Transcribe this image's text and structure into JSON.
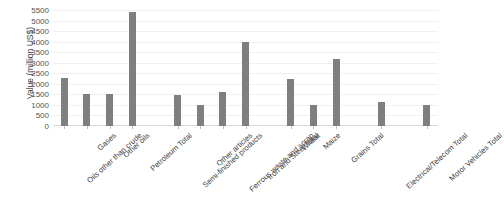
{
  "chart_data": {
    "type": "bar",
    "title": "",
    "xlabel": "",
    "ylabel": "Value (million US$)",
    "ylim": [
      0,
      5500
    ],
    "yticks": [
      0,
      500,
      1000,
      1500,
      2000,
      2500,
      3000,
      3500,
      4000,
      4500,
      5000,
      5500
    ],
    "ytick_labels": [
      "0",
      "500",
      "1000",
      "1500",
      "2000",
      "2500",
      "3000",
      "3500",
      "4000",
      "4500",
      "5000",
      "5500"
    ],
    "grid": true,
    "legend": "none",
    "bar_color": "#7f7f7f",
    "categories": [
      "Oils other than crude",
      "Gases",
      "Other oils",
      "Petroleum Total",
      "Semi-finished products",
      "Other articles",
      "Ferrous waste and scrap",
      "Iron and Steel Total",
      "Wheat",
      "Maize",
      "Grains Total",
      "Electrical/Telecom Total",
      "Motor Vehicles Total"
    ],
    "values": [
      2300,
      1500,
      1520,
      5400,
      1480,
      1020,
      1620,
      4000,
      2250,
      1000,
      3200,
      1120,
      1000
    ],
    "groups": [
      {
        "name": "Petroleum",
        "members": [
          "Oils other than crude",
          "Gases",
          "Other oils",
          "Petroleum Total"
        ]
      },
      {
        "name": "Iron and Steel",
        "members": [
          "Semi-finished products",
          "Other articles",
          "Ferrous waste and scrap",
          "Iron and Steel Total"
        ]
      },
      {
        "name": "Grains",
        "members": [
          "Wheat",
          "Maize",
          "Grains Total"
        ]
      },
      {
        "name": "Electrical/Telecom",
        "members": [
          "Electrical/Telecom Total"
        ]
      },
      {
        "name": "Motor Vehicles",
        "members": [
          "Motor Vehicles Total"
        ]
      }
    ]
  }
}
